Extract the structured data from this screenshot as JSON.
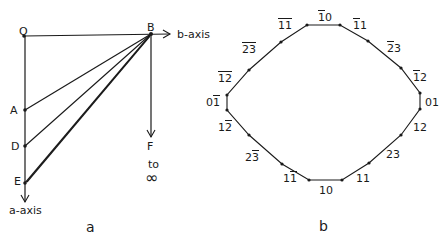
{
  "panel_a": {
    "caption": "a",
    "points": {
      "O": {
        "label": "O",
        "x": 24,
        "y": 36
      },
      "B": {
        "label": "B",
        "x": 150,
        "y": 34
      },
      "A": {
        "label": "A",
        "x": 25,
        "y": 110
      },
      "D": {
        "label": "D",
        "x": 25,
        "y": 146
      },
      "E": {
        "label": "E",
        "x": 25,
        "y": 183
      }
    },
    "b_axis_label": "b-axis",
    "a_axis_label": "a-axis",
    "F_label": "F",
    "to_label": "to",
    "infinity_label": "∞"
  },
  "panel_b": {
    "caption": "b",
    "labels": [
      {
        "id": "m1-0",
        "h": "1",
        "h_bar": true,
        "k": "0",
        "k_bar": false
      },
      {
        "id": "m1-1",
        "h": "1",
        "h_bar": true,
        "k": "1",
        "k_bar": false
      },
      {
        "id": "m2-3",
        "h": "2",
        "h_bar": true,
        "k": "3",
        "k_bar": false
      },
      {
        "id": "m1-2",
        "h": "1",
        "h_bar": true,
        "k": "2",
        "k_bar": false
      },
      {
        "id": "0-1",
        "h": "0",
        "h_bar": false,
        "k": "1",
        "k_bar": false
      },
      {
        "id": "1-2",
        "h": "1",
        "h_bar": false,
        "k": "2",
        "k_bar": false
      },
      {
        "id": "2-3",
        "h": "2",
        "h_bar": false,
        "k": "3",
        "k_bar": false
      },
      {
        "id": "1-1",
        "h": "1",
        "h_bar": false,
        "k": "1",
        "k_bar": false
      },
      {
        "id": "1-0",
        "h": "1",
        "h_bar": false,
        "k": "0",
        "k_bar": false
      },
      {
        "id": "1-m1",
        "h": "1",
        "h_bar": false,
        "k": "1",
        "k_bar": true
      },
      {
        "id": "2-m3",
        "h": "2",
        "h_bar": false,
        "k": "3",
        "k_bar": true
      },
      {
        "id": "1-m2",
        "h": "1",
        "h_bar": false,
        "k": "2",
        "k_bar": true
      },
      {
        "id": "0-m1",
        "h": "0",
        "h_bar": false,
        "k": "1",
        "k_bar": true
      },
      {
        "id": "m1-m2",
        "h": "1",
        "h_bar": true,
        "k": "2",
        "k_bar": true
      },
      {
        "id": "m2-m3",
        "h": "2",
        "h_bar": true,
        "k": "3",
        "k_bar": true
      },
      {
        "id": "m1-m1",
        "h": "1",
        "h_bar": true,
        "k": "1",
        "k_bar": true
      }
    ]
  }
}
